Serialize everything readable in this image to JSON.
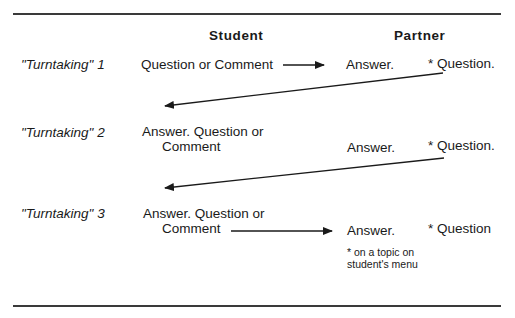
{
  "headers": {
    "student": "Student",
    "partner": "Partner"
  },
  "rows": [
    {
      "label_quoted": "\"Turntaking\"",
      "label_num": " 1",
      "student_line1": "Question or Comment",
      "student_line2": "",
      "partner_answer": "Answer.",
      "partner_question": "* Question."
    },
    {
      "label_quoted": "\"Turntaking\"",
      "label_num": " 2",
      "student_line1": "Answer.  Question or",
      "student_line2": "Comment",
      "partner_answer": "Answer.",
      "partner_question": "* Question."
    },
    {
      "label_quoted": "\"Turntaking\"",
      "label_num": " 3",
      "student_line1": "Answer.  Question or",
      "student_line2": "Comment",
      "partner_answer": "Answer.",
      "partner_question": "* Question"
    }
  ],
  "footnote": "* on a topic on student's menu",
  "colors": {
    "ink": "#1a1a1a",
    "rule": "#3a3a3a"
  }
}
